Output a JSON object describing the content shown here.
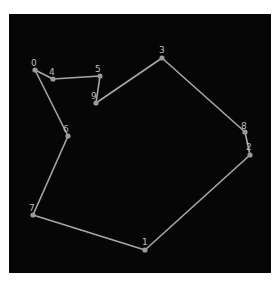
{
  "diagram": {
    "type": "tour-graph",
    "background": "#060606",
    "edge_color": "#a8a8a8",
    "node_color": "#9a9a9a",
    "nodes": [
      {
        "id": "0",
        "x": 35,
        "y": 70,
        "label": "0",
        "lx": 31,
        "ly": 66
      },
      {
        "id": "1",
        "x": 145,
        "y": 250,
        "label": "1",
        "lx": 142,
        "ly": 245
      },
      {
        "id": "2",
        "x": 250,
        "y": 155,
        "label": "2",
        "lx": 246,
        "ly": 150
      },
      {
        "id": "3",
        "x": 162,
        "y": 58,
        "label": "3",
        "lx": 159,
        "ly": 53
      },
      {
        "id": "4",
        "x": 53,
        "y": 79,
        "label": "4",
        "lx": 49,
        "ly": 75
      },
      {
        "id": "5",
        "x": 100,
        "y": 76,
        "label": "5",
        "lx": 95,
        "ly": 72
      },
      {
        "id": "6",
        "x": 68,
        "y": 136,
        "label": "6",
        "lx": 63,
        "ly": 132
      },
      {
        "id": "7",
        "x": 33,
        "y": 215,
        "label": "7",
        "lx": 29,
        "ly": 211
      },
      {
        "id": "8",
        "x": 245,
        "y": 132,
        "label": "8",
        "lx": 241,
        "ly": 129
      },
      {
        "id": "9",
        "x": 96,
        "y": 103,
        "label": "9",
        "lx": 91,
        "ly": 99
      }
    ],
    "tour": [
      "0",
      "4",
      "5",
      "9",
      "3",
      "8",
      "2",
      "1",
      "7",
      "6",
      "0"
    ]
  }
}
